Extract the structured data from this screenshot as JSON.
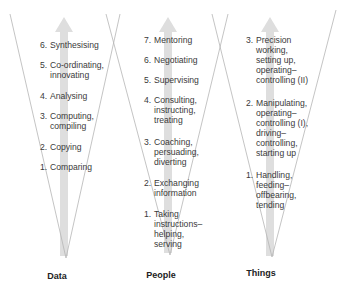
{
  "columns": [
    {
      "label": "Data",
      "items": [
        {
          "num": "6.",
          "lines": [
            "Synthesising"
          ]
        },
        {
          "num": "5.",
          "lines": [
            "Co-ordinating,",
            "innovating"
          ]
        },
        {
          "num": "4.",
          "lines": [
            "Analysing"
          ]
        },
        {
          "num": "3.",
          "lines": [
            "Computing,",
            "compiling"
          ]
        },
        {
          "num": "2.",
          "lines": [
            "Copying"
          ]
        },
        {
          "num": "1.",
          "lines": [
            "Comparing"
          ]
        }
      ]
    },
    {
      "label": "People",
      "items": [
        {
          "num": "7.",
          "lines": [
            "Mentoring"
          ]
        },
        {
          "num": "6.",
          "lines": [
            "Negotiating"
          ]
        },
        {
          "num": "5.",
          "lines": [
            "Supervising"
          ]
        },
        {
          "num": "4.",
          "lines": [
            "Consulting,",
            "instructing,",
            "treating"
          ]
        },
        {
          "num": "3.",
          "lines": [
            "Coaching,",
            "persuading,",
            "diverting"
          ]
        },
        {
          "num": "2.",
          "lines": [
            "Exchanging",
            "information"
          ]
        },
        {
          "num": "1.",
          "lines": [
            "Taking",
            "instructions–",
            "helping,",
            "serving"
          ]
        }
      ]
    },
    {
      "label": "Things",
      "items": [
        {
          "num": "3.",
          "lines": [
            "Precision",
            "working,",
            "setting up,",
            "operating–",
            "controlling (II)"
          ]
        },
        {
          "num": "2.",
          "lines": [
            "Manipulating,",
            "operating–",
            "controlling (I),",
            "driving–",
            "controlling,",
            "starting up"
          ]
        },
        {
          "num": "1.",
          "lines": [
            "Handling,",
            "feeding–",
            "offbearing,",
            "tending"
          ]
        }
      ]
    }
  ],
  "colors": {
    "triangle_line": "#b8b8b8",
    "arrow": "#dcdcdc",
    "text": "#3a3a3a"
  }
}
